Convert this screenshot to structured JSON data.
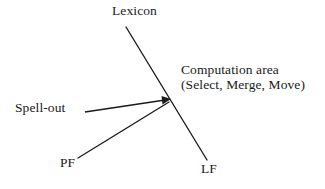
{
  "diagram": {
    "background_color": "#ffffff",
    "stroke_color": "#1a1a1a",
    "labels": {
      "lexicon": "Lexicon",
      "spell_out": "Spell-out",
      "pf": "PF",
      "lf": "LF",
      "computation_area_line1": "Computation area",
      "computation_area_line2": "(Select, Merge, Move)"
    },
    "lines": [
      {
        "name": "lexicon-to-lf-line",
        "from": [
          126,
          27
        ],
        "to": [
          207,
          160
        ]
      },
      {
        "name": "pf-branch-line",
        "from": [
          78,
          158
        ],
        "to": [
          169,
          102
        ]
      }
    ],
    "arrows": [
      {
        "name": "spell-out-arrow",
        "from": [
          85,
          112
        ],
        "to": [
          170,
          99
        ]
      }
    ]
  }
}
